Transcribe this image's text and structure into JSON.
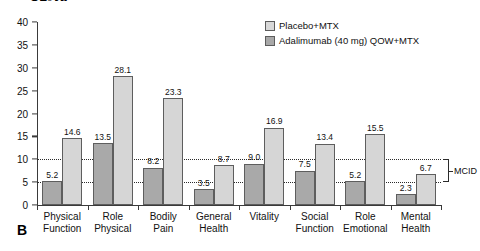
{
  "figure": {
    "panel_letter": "B",
    "truncated_title": "SF-36"
  },
  "legend": {
    "position": "top-right",
    "items": [
      {
        "label": "Placebo+MTX",
        "color": "#d8d8d8",
        "swatch_name": "legend-swatch-placebo"
      },
      {
        "label": "Adalimumab (40 mg) QOW+MTX",
        "color": "#a8a8a8",
        "swatch_name": "legend-swatch-adalimumab"
      }
    ]
  },
  "annotations": {
    "mcid_label": "MCID",
    "mcid_lower": 5,
    "mcid_upper": 10
  },
  "axis": {
    "y_ticks": [
      "0",
      "5",
      "10",
      "15",
      "20",
      "25",
      "30",
      "35",
      "40"
    ]
  },
  "chart_data": {
    "type": "bar",
    "title": "SF-36",
    "xlabel": "",
    "ylabel": "",
    "ylim": [
      0,
      40
    ],
    "ytick_step": 5,
    "grid": "two dotted horizontal reference lines at y = 5 and y = 10 (MCID band)",
    "legend_position": "top-right",
    "categories": [
      "Physical Function",
      "Role Physical",
      "Bodily Pain",
      "General Health",
      "Vitality",
      "Social Function",
      "Role Emotional",
      "Mental Health"
    ],
    "category_lines": [
      [
        "Physical",
        "Function"
      ],
      [
        "Role",
        "Physical"
      ],
      [
        "Bodily",
        "Pain"
      ],
      [
        "General",
        "Health"
      ],
      [
        "Vitality",
        ""
      ],
      [
        "Social",
        "Function"
      ],
      [
        "Role",
        "Emotional"
      ],
      [
        "Mental",
        "Health"
      ]
    ],
    "series": [
      {
        "name": "Placebo+MTX",
        "color": "#a9a9a9",
        "values": [
          5.2,
          13.5,
          8.2,
          3.5,
          9.0,
          7.5,
          5.2,
          2.3
        ],
        "labels": [
          "5.2",
          "13.5",
          "8.2",
          "3.5",
          "9.0",
          "7.5",
          "5.2",
          "2.3"
        ]
      },
      {
        "name": "Adalimumab (40 mg) QOW+MTX",
        "color": "#d6d6d6",
        "values": [
          14.6,
          28.1,
          23.3,
          8.7,
          16.9,
          13.4,
          15.5,
          6.7
        ],
        "labels": [
          "14.6",
          "28.1",
          "23.3",
          "8.7",
          "16.9",
          "13.4",
          "15.5",
          "6.7"
        ]
      }
    ],
    "reference_lines": [
      {
        "value": 10,
        "style": "dotted",
        "name": "mcid-upper-line"
      },
      {
        "value": 5,
        "style": "dotted",
        "name": "mcid-lower-line"
      }
    ]
  }
}
